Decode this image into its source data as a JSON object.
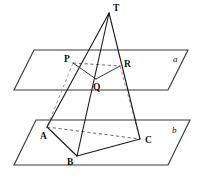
{
  "figure": {
    "background_color": "#ffffff",
    "line_color": "#1a1a1a",
    "hidden_line_color": "#5a5a5a",
    "width": 201,
    "height": 184
  },
  "labels": {
    "apex": "T",
    "section_left": "P",
    "section_bottom": "Q",
    "section_right": "R",
    "base_left": "A",
    "base_bottom": "B",
    "base_right": "C",
    "plane_upper": "a",
    "plane_lower": "b"
  },
  "points": {
    "T": {
      "x": 109,
      "y": 13
    },
    "P": {
      "x": 73,
      "y": 63
    },
    "Q": {
      "x": 96,
      "y": 79
    },
    "R": {
      "x": 120,
      "y": 66
    },
    "A": {
      "x": 47,
      "y": 127
    },
    "B": {
      "x": 77,
      "y": 156
    },
    "C": {
      "x": 140,
      "y": 139
    }
  },
  "label_positions": {
    "T": {
      "x": 113,
      "y": 11
    },
    "P": {
      "x": 64,
      "y": 62
    },
    "Q": {
      "x": 93,
      "y": 90
    },
    "R": {
      "x": 124,
      "y": 67
    },
    "A": {
      "x": 40,
      "y": 139
    },
    "B": {
      "x": 67,
      "y": 165
    },
    "C": {
      "x": 145,
      "y": 143
    },
    "a": {
      "x": 173,
      "y": 62
    },
    "b": {
      "x": 172,
      "y": 133
    }
  },
  "planes": {
    "upper": {
      "name": "a",
      "corners": [
        {
          "x": 34,
          "y": 50
        },
        {
          "x": 188,
          "y": 50
        },
        {
          "x": 168,
          "y": 90
        },
        {
          "x": 14,
          "y": 90
        }
      ]
    },
    "lower": {
      "name": "b",
      "corners": [
        {
          "x": 36,
          "y": 120
        },
        {
          "x": 190,
          "y": 120
        },
        {
          "x": 168,
          "y": 165
        },
        {
          "x": 14,
          "y": 165
        }
      ]
    }
  },
  "edges": {
    "solid": [
      {
        "name": "T-P-A",
        "from": "T",
        "to": "A",
        "via": "P"
      },
      {
        "name": "T-R-C",
        "from": "T",
        "to": "C",
        "via": "R"
      },
      {
        "name": "T-Q-B",
        "from": "T",
        "to": "B",
        "via": "Q"
      },
      {
        "name": "P-Q",
        "from": "P",
        "to": "Q"
      },
      {
        "name": "Q-R",
        "from": "Q",
        "to": "R"
      },
      {
        "name": "A-B",
        "from": "A",
        "to": "B"
      },
      {
        "name": "B-C",
        "from": "B",
        "to": "C"
      }
    ],
    "dashed": [
      {
        "name": "P-R",
        "from": "P",
        "to": "R"
      },
      {
        "name": "A-C",
        "from": "A",
        "to": "C"
      },
      {
        "name": "T-P-left-guide",
        "from": "P",
        "to": "A"
      },
      {
        "name": "T-R-right-guide",
        "from": "R",
        "to": "C"
      }
    ]
  }
}
